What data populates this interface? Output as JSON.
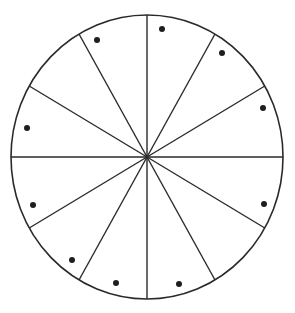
{
  "diagram": {
    "type": "divided-circle",
    "center": [
      147,
      157
    ],
    "radius_x": 136,
    "radius_y": 142,
    "sector_count": 12,
    "sector_angle_deg": 30,
    "spoke_angles_deg": [
      0,
      30,
      60,
      90,
      120,
      150
    ],
    "colors": {
      "background": "#ffffff",
      "line": "#2a2a2a",
      "dot": "#1e1e1e"
    },
    "sectors": [
      {
        "range_deg": "0-30",
        "has_dot": true,
        "dot": [
          263,
          108
        ]
      },
      {
        "range_deg": "30-60",
        "has_dot": true,
        "dot": [
          222,
          53
        ]
      },
      {
        "range_deg": "60-90",
        "has_dot": true,
        "dot": [
          162,
          29
        ]
      },
      {
        "range_deg": "90-120",
        "has_dot": true,
        "dot": [
          97,
          40
        ]
      },
      {
        "range_deg": "120-150",
        "has_dot": false,
        "dot": null
      },
      {
        "range_deg": "150-180",
        "has_dot": true,
        "dot": [
          27,
          128
        ]
      },
      {
        "range_deg": "180-210",
        "has_dot": true,
        "dot": [
          33,
          205
        ]
      },
      {
        "range_deg": "210-240",
        "has_dot": true,
        "dot": [
          72,
          260
        ]
      },
      {
        "range_deg": "240-270",
        "has_dot": true,
        "dot": [
          116,
          283
        ]
      },
      {
        "range_deg": "270-300",
        "has_dot": true,
        "dot": [
          179,
          284
        ]
      },
      {
        "range_deg": "300-330",
        "has_dot": false,
        "dot": null
      },
      {
        "range_deg": "330-360",
        "has_dot": true,
        "dot": [
          264,
          204
        ]
      }
    ],
    "dot_count": 10,
    "dot_radius": 3
  }
}
